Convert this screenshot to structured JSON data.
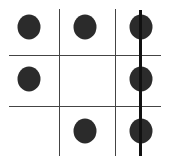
{
  "board": {
    "rows": 3,
    "cols": 3,
    "cells": [
      [
        "dot",
        "dot",
        "dot"
      ],
      [
        "dot",
        "",
        "dot"
      ],
      [
        "",
        "dot",
        "dot"
      ]
    ],
    "winning_line": {
      "orientation": "vertical",
      "column": 3
    },
    "colors": {
      "piece": "#2b2b2b",
      "grid": "#444444",
      "win_line": "#111111"
    }
  }
}
